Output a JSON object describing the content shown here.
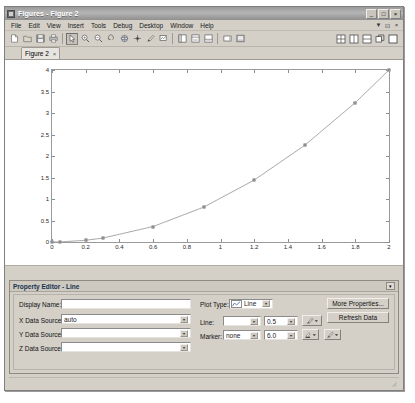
{
  "window": {
    "title": "Figures - Figure 2",
    "app_icon": "figures-icon",
    "controls": {
      "minimize": "_",
      "maximize": "□",
      "close": "×"
    },
    "doc_controls": {
      "minimize": "▼",
      "float": "⊡",
      "close": "×"
    }
  },
  "menubar": {
    "items": [
      "File",
      "Edit",
      "View",
      "Insert",
      "Tools",
      "Debug",
      "Desktop",
      "Window",
      "Help"
    ]
  },
  "toolbar": {
    "left_buttons": [
      {
        "name": "new-figure-icon",
        "tip": "New Figure"
      },
      {
        "name": "open-file-icon",
        "tip": "Open File"
      },
      {
        "name": "save-figure-icon",
        "tip": "Save Figure"
      },
      {
        "name": "print-figure-icon",
        "tip": "Print Figure"
      }
    ],
    "tool_buttons": [
      {
        "name": "edit-plot-arrow-icon",
        "tip": "Edit Plot",
        "pressed": true
      },
      {
        "name": "zoom-in-icon",
        "tip": "Zoom In"
      },
      {
        "name": "zoom-out-icon",
        "tip": "Zoom Out"
      },
      {
        "name": "pan-icon",
        "tip": "Pan"
      },
      {
        "name": "rotate-3d-icon",
        "tip": "Rotate 3D"
      },
      {
        "name": "data-cursor-icon",
        "tip": "Data Cursor"
      },
      {
        "name": "brush-icon",
        "tip": "Brush/Select Data"
      },
      {
        "name": "link-data-icon",
        "tip": "Link Plot"
      }
    ],
    "panel_buttons": [
      {
        "name": "figure-palette-icon",
        "tip": "Figure Palette"
      },
      {
        "name": "plot-browser-icon",
        "tip": "Plot Browser"
      },
      {
        "name": "property-editor-icon",
        "tip": "Property Editor"
      }
    ],
    "extra_buttons": [
      {
        "name": "insert-colorbar-icon",
        "tip": "Insert Colorbar"
      },
      {
        "name": "insert-legend-icon",
        "tip": "Insert Legend"
      }
    ],
    "right_buttons": [
      {
        "name": "tile-grid-layout-icon",
        "tip": "Tile Grid"
      },
      {
        "name": "tile-vertical-layout-icon",
        "tip": "Tile Vertical"
      },
      {
        "name": "tile-horizontal-layout-icon",
        "tip": "Tile Horizontal"
      },
      {
        "name": "undock-figure-icon",
        "tip": "Undock Figure"
      },
      {
        "name": "maximize-figure-icon",
        "tip": "Maximize Figure"
      }
    ]
  },
  "tabs": [
    {
      "label": "Figure 2",
      "close": "×",
      "active": true
    }
  ],
  "chart_data": {
    "type": "line",
    "title": "",
    "xlabel": "",
    "ylabel": "",
    "xlim": [
      0,
      2
    ],
    "ylim": [
      0,
      4
    ],
    "xticks": [
      0,
      0.2,
      0.4,
      0.6,
      0.8,
      1,
      1.2,
      1.4,
      1.6,
      1.8,
      2
    ],
    "xticklabels": [
      "0",
      "0.2",
      "0.4",
      "0.6",
      "0.8",
      "1",
      "1.2",
      "1.4",
      "1.6",
      "1.8",
      "2"
    ],
    "yticks": [
      0,
      0.5,
      1,
      1.5,
      2,
      2.5,
      3,
      3.5,
      4
    ],
    "yticklabels": [
      "0",
      "0.5",
      "1",
      "1.5",
      "2",
      "2.5",
      "3",
      "3.5",
      "4"
    ],
    "grid": false,
    "legend": null,
    "series": [
      {
        "name": "Line",
        "line_color": "#808080",
        "marker": "square",
        "marker_color": "#6a6a6a",
        "x": [
          0,
          0.05,
          0.2,
          0.3,
          0.6,
          0.9,
          1.2,
          1.5,
          1.8,
          2
        ],
        "y": [
          0,
          0.0025,
          0.04,
          0.09,
          0.36,
          0.81,
          1.44,
          2.25,
          3.24,
          4
        ]
      }
    ]
  },
  "property_editor": {
    "title": "Property Editor - Line",
    "collapse_glyph": "▾",
    "fields": {
      "display_name": {
        "label": "Display Name:",
        "value": ""
      },
      "x_data_source": {
        "label": "X Data Source:",
        "value": "auto"
      },
      "y_data_source": {
        "label": "Y Data Source:",
        "value": ""
      },
      "z_data_source": {
        "label": "Z Data Source:",
        "value": ""
      },
      "plot_type": {
        "label": "Plot Type:",
        "value": "Line"
      },
      "line_style": {
        "label": "Line:",
        "value": "",
        "width": "0.5"
      },
      "marker": {
        "label": "Marker:",
        "value": "none",
        "size": "6.0"
      }
    },
    "buttons": {
      "more_properties": "More Properties...",
      "refresh_data": "Refresh Data"
    },
    "color_pickers": [
      {
        "name": "line-color-picker",
        "label": "Line Color"
      },
      {
        "name": "marker-face-color-picker",
        "label": "Marker Face Color"
      },
      {
        "name": "marker-edge-color-picker",
        "label": "Marker Edge Color"
      }
    ]
  }
}
